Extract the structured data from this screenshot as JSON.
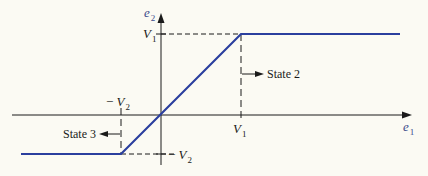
{
  "diagram": {
    "type": "piecewise-linear transfer characteristic",
    "axes": {
      "x": {
        "label": "e",
        "subscript": "1"
      },
      "y": {
        "label": "e",
        "subscript": "2"
      }
    },
    "ticks": {
      "v1_x": {
        "label": "V",
        "subscript": "1"
      },
      "v1_y": {
        "label": "V",
        "subscript": "1"
      },
      "neg_v2_x": {
        "prefix": "− ",
        "label": "V",
        "subscript": "2"
      },
      "neg_v2_y": {
        "prefix": "− ",
        "label": "V",
        "subscript": "2"
      }
    },
    "annotations": {
      "state2": "State 2",
      "state3": "State 3"
    },
    "colors": {
      "curve": "#2b3f9e",
      "axes": "#1a1a1a",
      "background": "#fbfaf3"
    }
  }
}
